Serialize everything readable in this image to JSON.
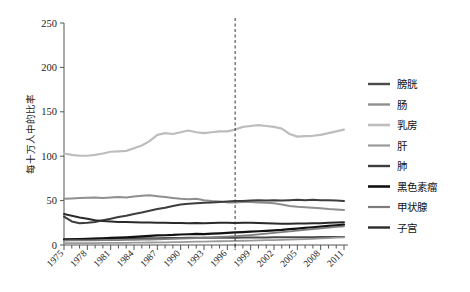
{
  "chart_data": {
    "type": "line",
    "title": "",
    "xlabel": "",
    "ylabel": "每十万人中的比率",
    "xlim": [
      1975,
      2011
    ],
    "ylim": [
      0,
      250
    ],
    "yticks": [
      0,
      50,
      100,
      150,
      200,
      250
    ],
    "ytick_labels": [
      "0",
      "50",
      "100",
      "150",
      "200",
      "250"
    ],
    "xticks": [
      1975,
      1978,
      1981,
      1984,
      1987,
      1990,
      1993,
      1996,
      1999,
      2002,
      2005,
      2008,
      2011
    ],
    "xtick_labels": [
      "1975",
      "1978",
      "1981",
      "1984",
      "1987",
      "1990",
      "1993",
      "1996",
      "1999",
      "2002",
      "2005",
      "2008",
      "2011"
    ],
    "grid": false,
    "legend_position": "right",
    "annotations": [
      {
        "name": "vertical-dashed-marker",
        "type": "vline",
        "x": 1997,
        "style": "dashed",
        "color": "#333333"
      }
    ],
    "x": [
      1975,
      1976,
      1977,
      1978,
      1979,
      1980,
      1981,
      1982,
      1983,
      1984,
      1985,
      1986,
      1987,
      1988,
      1989,
      1990,
      1991,
      1992,
      1993,
      1994,
      1995,
      1996,
      1997,
      1998,
      1999,
      2000,
      2001,
      2002,
      2003,
      2004,
      2005,
      2006,
      2007,
      2008,
      2009,
      2010,
      2011
    ],
    "series": [
      {
        "name": "膀胱",
        "color": "#4a4a4a",
        "width": 2.0,
        "values": [
          6.5,
          6.6,
          6.7,
          6.8,
          6.9,
          7.0,
          7.1,
          7.2,
          7.3,
          7.4,
          7.5,
          7.6,
          7.7,
          7.8,
          7.9,
          8.0,
          8.1,
          8.2,
          8.2,
          8.2,
          8.2,
          8.3,
          8.3,
          8.4,
          8.4,
          8.5,
          8.5,
          8.6,
          8.6,
          8.7,
          8.7,
          8.8,
          8.8,
          8.9,
          8.9,
          9.0,
          9.0
        ]
      },
      {
        "name": "肠",
        "color": "#8f8f8f",
        "width": 2.0,
        "values": [
          52.0,
          52.5,
          53.0,
          53.2,
          53.5,
          53.0,
          53.5,
          54.0,
          53.5,
          54.5,
          55.5,
          56.0,
          55.0,
          54.0,
          53.0,
          52.0,
          51.5,
          52.0,
          50.5,
          49.5,
          49.0,
          48.0,
          48.0,
          48.5,
          48.5,
          48.0,
          47.5,
          47.0,
          45.5,
          44.0,
          43.0,
          42.5,
          42.0,
          41.5,
          40.5,
          40.0,
          39.5
        ]
      },
      {
        "name": "乳房",
        "color": "#bdbdbd",
        "width": 2.2,
        "values": [
          103.0,
          101.5,
          100.5,
          100.5,
          101.5,
          103.0,
          105.0,
          105.5,
          106.0,
          109.0,
          112.0,
          117.0,
          124.0,
          126.0,
          125.0,
          127.0,
          129.0,
          127.0,
          126.0,
          127.0,
          128.0,
          128.0,
          130.0,
          133.0,
          134.0,
          135.0,
          134.0,
          133.0,
          131.0,
          125.0,
          122.0,
          122.5,
          123.0,
          124.0,
          126.0,
          128.0,
          130.0
        ]
      },
      {
        "name": "肝",
        "color": "#9a9a9a",
        "width": 1.8,
        "values": [
          2.0,
          2.0,
          2.1,
          2.2,
          2.2,
          2.3,
          2.4,
          2.4,
          2.5,
          2.6,
          2.7,
          2.8,
          2.9,
          3.0,
          3.2,
          3.3,
          3.5,
          3.7,
          3.9,
          4.0,
          4.2,
          4.4,
          4.6,
          4.8,
          5.0,
          5.2,
          5.4,
          5.6,
          5.8,
          6.1,
          6.4,
          6.7,
          7.0,
          7.4,
          7.8,
          8.2,
          8.6
        ]
      },
      {
        "name": "肺",
        "color": "#3d3d3d",
        "width": 2.0,
        "values": [
          32.0,
          26.5,
          24.5,
          25.0,
          26.0,
          28.0,
          29.5,
          31.5,
          33.0,
          35.0,
          36.5,
          38.5,
          40.5,
          42.0,
          44.0,
          45.5,
          46.5,
          47.0,
          47.5,
          48.0,
          48.5,
          49.0,
          49.5,
          49.5,
          50.0,
          50.5,
          50.0,
          50.5,
          50.0,
          50.5,
          51.0,
          50.5,
          51.0,
          50.5,
          50.5,
          50.0,
          49.5
        ]
      },
      {
        "name": "黑色素瘤",
        "color": "#111111",
        "width": 2.2,
        "values": [
          6.0,
          6.3,
          6.6,
          6.9,
          7.2,
          7.6,
          8.0,
          8.3,
          8.7,
          9.2,
          9.8,
          10.3,
          10.8,
          11.0,
          11.3,
          11.8,
          12.1,
          12.5,
          12.2,
          12.8,
          13.2,
          13.6,
          14.2,
          14.5,
          15.0,
          15.5,
          16.0,
          16.5,
          17.0,
          17.8,
          18.5,
          19.2,
          20.0,
          20.8,
          21.5,
          22.2,
          23.0
        ]
      },
      {
        "name": "甲状腺",
        "color": "#7d7d7d",
        "width": 1.8,
        "values": [
          5.0,
          5.1,
          5.2,
          5.2,
          5.3,
          5.4,
          5.5,
          5.6,
          5.7,
          5.8,
          6.0,
          6.2,
          6.4,
          6.6,
          6.8,
          7.1,
          7.4,
          7.8,
          8.2,
          8.6,
          9.0,
          9.5,
          10.0,
          10.6,
          11.2,
          12.0,
          12.8,
          13.6,
          14.5,
          15.4,
          16.3,
          17.2,
          18.0,
          18.8,
          19.6,
          20.3,
          21.0
        ]
      },
      {
        "name": "子宫",
        "color": "#2a2a2a",
        "width": 2.0,
        "values": [
          35.0,
          33.0,
          31.0,
          29.5,
          28.0,
          27.0,
          26.5,
          26.0,
          25.8,
          25.5,
          25.3,
          25.2,
          25.0,
          25.0,
          24.8,
          24.8,
          24.6,
          24.8,
          24.5,
          24.8,
          25.0,
          25.0,
          24.8,
          25.0,
          25.0,
          24.8,
          24.5,
          24.3,
          24.0,
          24.0,
          24.2,
          24.3,
          24.5,
          24.6,
          25.0,
          25.2,
          25.5
        ]
      }
    ]
  },
  "legend": {
    "items": [
      {
        "label": "膀胱"
      },
      {
        "label": "肠"
      },
      {
        "label": "乳房"
      },
      {
        "label": "肝"
      },
      {
        "label": "肺"
      },
      {
        "label": "黑色素瘤"
      },
      {
        "label": "甲状腺"
      },
      {
        "label": "子宫"
      }
    ]
  }
}
